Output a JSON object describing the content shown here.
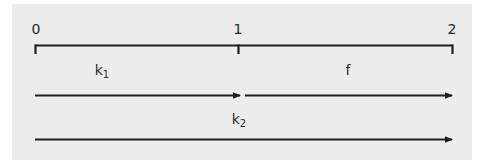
{
  "diagram": {
    "colors": {
      "panel_background": "#ececec",
      "page_background": "#ffffff",
      "stroke": "#1e1e1e",
      "text": "#2a2a2a"
    },
    "axis": {
      "ticks": [
        {
          "label": "0",
          "x": 35
        },
        {
          "label": "1",
          "x": 238
        },
        {
          "label": "2",
          "x": 452
        }
      ]
    },
    "segments": [
      {
        "name": "k1",
        "base": "k",
        "subscript": "1",
        "from": "0",
        "to": "1"
      },
      {
        "name": "f",
        "base": "f",
        "subscript": "",
        "from": "1",
        "to": "2"
      }
    ],
    "arrows": [
      {
        "name": "k1-arrow",
        "from": "0",
        "to": "1"
      },
      {
        "name": "f-arrow",
        "from": "1",
        "to": "2"
      },
      {
        "name": "k2-arrow",
        "from": "0",
        "to": "2",
        "label_base": "k",
        "label_subscript": "2"
      }
    ]
  }
}
